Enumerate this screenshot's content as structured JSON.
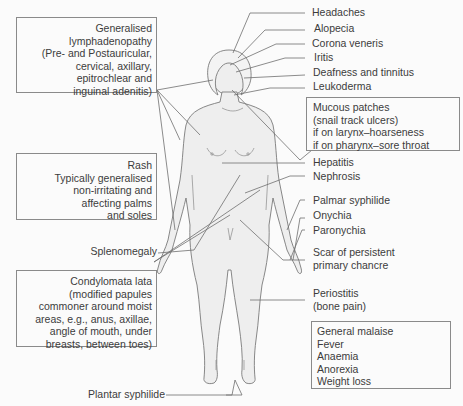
{
  "diagram": {
    "colors": {
      "line": "#6e6e6e",
      "body_fill": "#eeeeee",
      "body_outline": "#7a7a7a",
      "text": "#3c3c3c",
      "box_border": "#8a8a8a"
    },
    "left_boxes": {
      "lymphadenopathy": [
        "Generalised",
        "lymphadenopathy",
        "(Pre- and Postauricular,",
        "cervical, axillary,",
        "epitrochlear and",
        "inguinal adenitis)"
      ],
      "rash": [
        "Rash",
        "Typically generalised",
        "non-irritating and",
        "affecting palms",
        "and soles"
      ],
      "condylomata": [
        "Condylomata lata",
        "(modified papules",
        "commoner around moist",
        "areas, e.g., anus, axillae,",
        "angle of mouth, under",
        "breasts, between toes)"
      ]
    },
    "left_labels": {
      "splenomegaly": "Splenomegaly",
      "plantar": "Plantar syphilide"
    },
    "right_labels": {
      "headaches": "Headaches",
      "alopecia": "Alopecia",
      "corona": "Corona veneris",
      "iritis": "Iritis",
      "deafness": "Deafness and tinnitus",
      "leukoderma": "Leukoderma",
      "hepatitis": "Hepatitis",
      "nephrosis": "Nephrosis",
      "palmar": "Palmar syphilide",
      "onychia": "Onychia",
      "paronychia": "Paronychia",
      "scar_1": "Scar of persistent",
      "scar_2": "primary chancre",
      "periostitis_1": "Periostitis",
      "periostitis_2": "(bone pain)"
    },
    "right_boxes": {
      "mucous": [
        "Mucous patches",
        "(snail track ulcers)",
        "if on larynx–hoarseness",
        "if on pharynx–sore throat"
      ],
      "general": [
        "General malaise",
        "Fever",
        "Anaemia",
        "Anorexia",
        "Weight loss"
      ]
    }
  }
}
